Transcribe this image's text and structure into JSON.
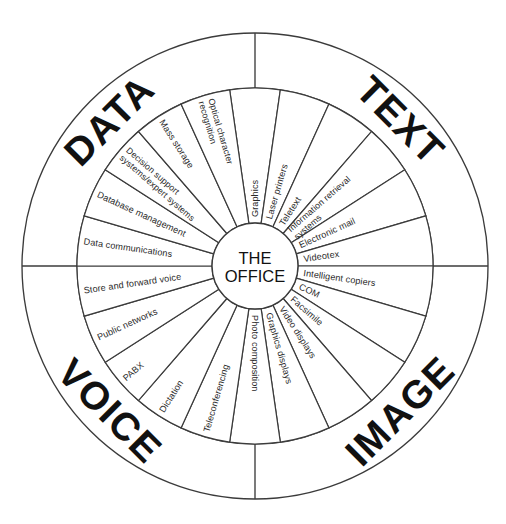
{
  "diagram": {
    "hub": {
      "line1": "THE",
      "line2": "OFFICE"
    },
    "geometry": {
      "center_x": 255,
      "center_y": 266,
      "outer_radius": 233,
      "ring_radius": 178,
      "hub_radius": 43,
      "sector_count": 22,
      "start_angle_deg": -90
    },
    "colors": {
      "stroke": "#3b3b3b",
      "text": "#2a2a2a",
      "heading": "#111111",
      "background": "#ffffff"
    },
    "outer_ring": {
      "quadrants": [
        {
          "id": "data",
          "label": "DATA",
          "position": "top-left"
        },
        {
          "id": "text",
          "label": "TEXT",
          "position": "top-right"
        },
        {
          "id": "image",
          "label": "IMAGE",
          "position": "bottom-right"
        },
        {
          "id": "voice",
          "label": "VOICE",
          "position": "bottom-left"
        }
      ]
    },
    "inner_ring": {
      "note": "22 sectors listed clockwise starting from the 12 o'clock position",
      "sectors": [
        {
          "index": 0,
          "label": "Graphics",
          "quadrant": "text"
        },
        {
          "index": 1,
          "label": "Laser printers",
          "quadrant": "text"
        },
        {
          "index": 2,
          "label": "Teletext",
          "quadrant": "text"
        },
        {
          "index": 3,
          "label": "Information retrieval systems",
          "quadrant": "text",
          "lines": [
            "Information retrieval",
            "systems"
          ]
        },
        {
          "index": 4,
          "label": "Electronic mail",
          "quadrant": "text"
        },
        {
          "index": 5,
          "label": "Videotex",
          "quadrant": "text"
        },
        {
          "index": 6,
          "label": "Intelligent copiers",
          "quadrant": "image"
        },
        {
          "index": 7,
          "label": "COM",
          "quadrant": "image"
        },
        {
          "index": 8,
          "label": "Facsimile",
          "quadrant": "image"
        },
        {
          "index": 9,
          "label": "Video displays",
          "quadrant": "image"
        },
        {
          "index": 10,
          "label": "Graphics displays",
          "quadrant": "image"
        },
        {
          "index": 11,
          "label": "Photo composition",
          "quadrant": "image"
        },
        {
          "index": 12,
          "label": "Teleconferencing",
          "quadrant": "voice"
        },
        {
          "index": 13,
          "label": "Dictation",
          "quadrant": "voice"
        },
        {
          "index": 14,
          "label": "PABX",
          "quadrant": "voice"
        },
        {
          "index": 15,
          "label": "Public networks",
          "quadrant": "voice"
        },
        {
          "index": 16,
          "label": "Store and forward voice",
          "quadrant": "voice"
        },
        {
          "index": 17,
          "label": "Data communications",
          "quadrant": "data"
        },
        {
          "index": 18,
          "label": "Database management",
          "quadrant": "data"
        },
        {
          "index": 19,
          "label": "Decision support systems/expert systems",
          "quadrant": "data",
          "lines": [
            "Decision support",
            "systems/expert systems"
          ]
        },
        {
          "index": 20,
          "label": "Mass storage",
          "quadrant": "data"
        },
        {
          "index": 21,
          "label": "Optical character recognition",
          "quadrant": "data",
          "lines": [
            "Optical character",
            "recognition"
          ]
        }
      ]
    }
  }
}
